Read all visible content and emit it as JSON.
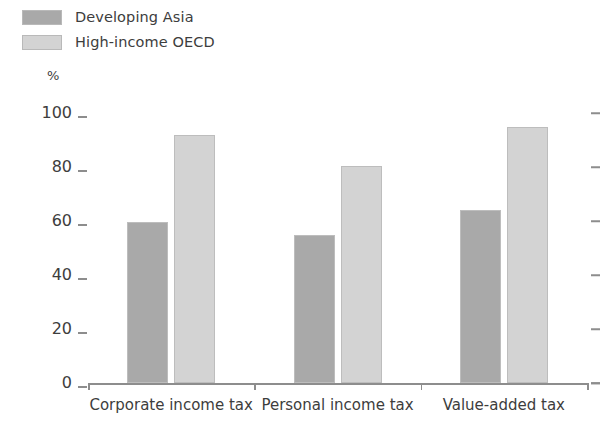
{
  "legend": {
    "items": [
      {
        "label": "Developing Asia",
        "color": "#a9a9a9",
        "key": "developing-asia"
      },
      {
        "label": "High-income OECD",
        "color": "#d3d3d3",
        "key": "high-income-oecd"
      }
    ]
  },
  "axis": {
    "unit": "%",
    "yticks": [
      "100",
      "80",
      "60",
      "40",
      "20",
      "0"
    ],
    "ytick_values": [
      100,
      80,
      60,
      40,
      20,
      0
    ]
  },
  "chart_data": {
    "type": "bar",
    "title": "",
    "subtitle": "",
    "xlabel": "",
    "ylabel": "%",
    "ylim": [
      0,
      100
    ],
    "grid": false,
    "legend_position": "top-left",
    "categories": [
      "Corporate income tax",
      "Personal income tax",
      "Value-added tax"
    ],
    "series": [
      {
        "name": "Developing Asia",
        "color": "#a9a9a9",
        "values": [
          59.5,
          55.0,
          64.0
        ]
      },
      {
        "name": "High-income OECD",
        "color": "#d3d3d3",
        "values": [
          92.0,
          80.5,
          95.0
        ]
      }
    ],
    "annotations": []
  }
}
